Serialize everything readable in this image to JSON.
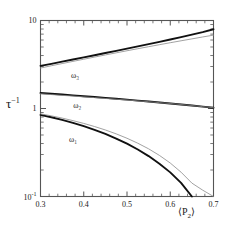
{
  "chart_data": {
    "type": "line",
    "title": "",
    "xlabel": "<P2>",
    "xlabel_display": "⟨P₂⟩",
    "ylabel": "tau^-1",
    "ylabel_display": "τ⁻¹",
    "xscale": "linear",
    "yscale": "log",
    "xlim": [
      0.3,
      0.7
    ],
    "ylim": [
      0.1,
      10
    ],
    "grid": false,
    "legend": "inline-annotations",
    "xticks": [
      0.3,
      0.4,
      0.5,
      0.6,
      0.7
    ],
    "xtick_labels": [
      "0.3",
      "0.4",
      "0.5",
      "0.6",
      "0.7"
    ],
    "yticks": [
      0.1,
      1,
      10
    ],
    "ytick_labels": [
      "10",
      "1",
      "10"
    ],
    "ytick_label_top": "10",
    "ytick_label_mid": "1",
    "ytick_label_bottom": "10",
    "ytick_bottom_exponent": "-1",
    "annotations": [
      {
        "text": "ω₃",
        "label": "omega-3",
        "x": 0.38,
        "y": 2.35
      },
      {
        "text": "ω₂",
        "label": "omega-2",
        "x": 0.385,
        "y": 1.07
      },
      {
        "text": "ω₁",
        "label": "omega-1",
        "x": 0.375,
        "y": 0.45
      }
    ],
    "x": [
      0.3,
      0.325,
      0.35,
      0.375,
      0.4,
      0.425,
      0.45,
      0.475,
      0.5,
      0.525,
      0.55,
      0.575,
      0.6,
      0.625,
      0.65,
      0.675,
      0.7
    ],
    "series": [
      {
        "name": "ω₃ thick",
        "style": "thick-black",
        "color": "#111111",
        "width": 1.9,
        "values": [
          3.05,
          3.22,
          3.41,
          3.6,
          3.81,
          4.03,
          4.27,
          4.52,
          4.79,
          5.08,
          5.39,
          5.72,
          6.08,
          6.47,
          6.9,
          7.38,
          7.95
        ]
      },
      {
        "name": "ω₃ thin",
        "style": "thin-gray",
        "color": "#8a8a8a",
        "width": 0.8,
        "values": [
          2.88,
          3.06,
          3.24,
          3.43,
          3.63,
          3.84,
          4.06,
          4.29,
          4.53,
          4.78,
          5.04,
          5.31,
          5.59,
          5.88,
          6.18,
          6.5,
          6.82
        ]
      },
      {
        "name": "ω₂ thick",
        "style": "thick-black",
        "color": "#111111",
        "width": 1.9,
        "values": [
          1.5,
          1.47,
          1.44,
          1.41,
          1.38,
          1.35,
          1.32,
          1.29,
          1.26,
          1.23,
          1.2,
          1.17,
          1.14,
          1.11,
          1.08,
          1.05,
          1.02
        ]
      },
      {
        "name": "ω₂ thin",
        "style": "thin-gray",
        "color": "#8a8a8a",
        "width": 0.8,
        "values": [
          1.47,
          1.44,
          1.41,
          1.385,
          1.355,
          1.33,
          1.3,
          1.275,
          1.25,
          1.22,
          1.195,
          1.165,
          1.14,
          1.11,
          1.08,
          1.05,
          1.02
        ]
      },
      {
        "name": "ω₁ thick",
        "style": "thick-black",
        "color": "#111111",
        "width": 1.9,
        "values": [
          0.845,
          0.795,
          0.742,
          0.687,
          0.63,
          0.572,
          0.514,
          0.455,
          0.398,
          0.342,
          0.288,
          0.236,
          0.188,
          0.143,
          0.1,
          0.1,
          0.1
        ]
      },
      {
        "name": "ω₁ thin",
        "style": "thin-gray",
        "color": "#8a8a8a",
        "width": 0.8,
        "values": [
          0.87,
          0.825,
          0.778,
          0.728,
          0.677,
          0.624,
          0.57,
          0.515,
          0.459,
          0.403,
          0.348,
          0.293,
          0.24,
          0.189,
          0.142,
          0.118,
          0.1
        ]
      }
    ],
    "frame_color": "#555555"
  },
  "figure": {
    "background": "#ffffff",
    "axis_color": "#555555"
  }
}
